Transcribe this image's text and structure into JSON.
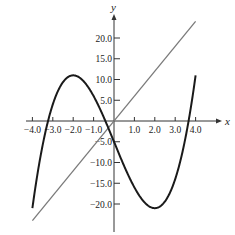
{
  "chart_data": {
    "type": "line",
    "title": "",
    "xlabel": "x",
    "ylabel": "y",
    "xlim": [
      -4.0,
      4.0
    ],
    "ylim": [
      -24.0,
      24.0
    ],
    "grid": false,
    "legend": null,
    "x_ticks": [
      -4.0,
      -3.0,
      -2.0,
      -1.0,
      1.0,
      2.0,
      3.0,
      4.0
    ],
    "x_tick_labels": [
      "−4.0",
      "−3.0",
      "−2.0",
      "−1.0",
      "1.0",
      "2.0",
      "3.0",
      "4.0"
    ],
    "y_ticks": [
      20.0,
      15.0,
      10.0,
      5.0,
      -5.0,
      -10.0,
      -15.0,
      -20.0
    ],
    "y_tick_labels": [
      "20.0",
      "15.0",
      "10.0",
      "5.0",
      "−5.0",
      "−10.0",
      "−15.0",
      "−20.0"
    ],
    "series": [
      {
        "name": "cubic",
        "expression": "y = x^3 - 12x - 5",
        "color": "#1a1a1a",
        "x": [
          -4.0,
          -3.5,
          -3.0,
          -2.5,
          -2.0,
          -1.5,
          -1.0,
          -0.5,
          0.0,
          0.5,
          1.0,
          1.5,
          2.0,
          2.5,
          3.0,
          3.5,
          4.0
        ],
        "values": [
          -21.0,
          -6.9,
          4.0,
          9.4,
          11.0,
          9.6,
          6.0,
          0.9,
          -5.0,
          -10.9,
          -16.0,
          -19.6,
          -21.0,
          -19.4,
          -14.0,
          -4.1,
          11.0
        ]
      },
      {
        "name": "line",
        "expression": "y = 6x",
        "color": "#7a7a7a",
        "x": [
          -4.0,
          4.0
        ],
        "values": [
          -24.0,
          24.0
        ]
      }
    ]
  },
  "axes": {
    "x_label": "x",
    "y_label": "y"
  }
}
